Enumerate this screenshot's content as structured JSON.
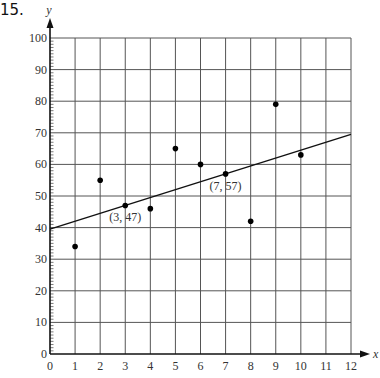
{
  "problem_number": "15.",
  "chart_data": {
    "type": "scatter",
    "title": "",
    "xlabel": "x",
    "ylabel": "y",
    "xlim": [
      0,
      12
    ],
    "ylim": [
      0,
      100
    ],
    "x_ticks": [
      0,
      1,
      2,
      3,
      4,
      5,
      6,
      7,
      8,
      9,
      10,
      11,
      12
    ],
    "y_ticks": [
      0,
      10,
      20,
      30,
      40,
      50,
      60,
      70,
      80,
      90,
      100
    ],
    "y_minor_tick_step": 1,
    "grid": true,
    "legend": null,
    "points": [
      {
        "x": 1,
        "y": 34
      },
      {
        "x": 2,
        "y": 55
      },
      {
        "x": 3,
        "y": 47
      },
      {
        "x": 4,
        "y": 46
      },
      {
        "x": 5,
        "y": 65
      },
      {
        "x": 6,
        "y": 60
      },
      {
        "x": 7,
        "y": 57
      },
      {
        "x": 8,
        "y": 42
      },
      {
        "x": 9,
        "y": 79
      },
      {
        "x": 10,
        "y": 63
      }
    ],
    "trend_line": {
      "x1": 0,
      "y1": 39.5,
      "x2": 12,
      "y2": 69.5,
      "slope": 2.5,
      "intercept": 39.5
    },
    "annotations": [
      {
        "text": "(3, 47)",
        "x": 3,
        "y": 47
      },
      {
        "text": "(7, 57)",
        "x": 7,
        "y": 57
      }
    ]
  }
}
